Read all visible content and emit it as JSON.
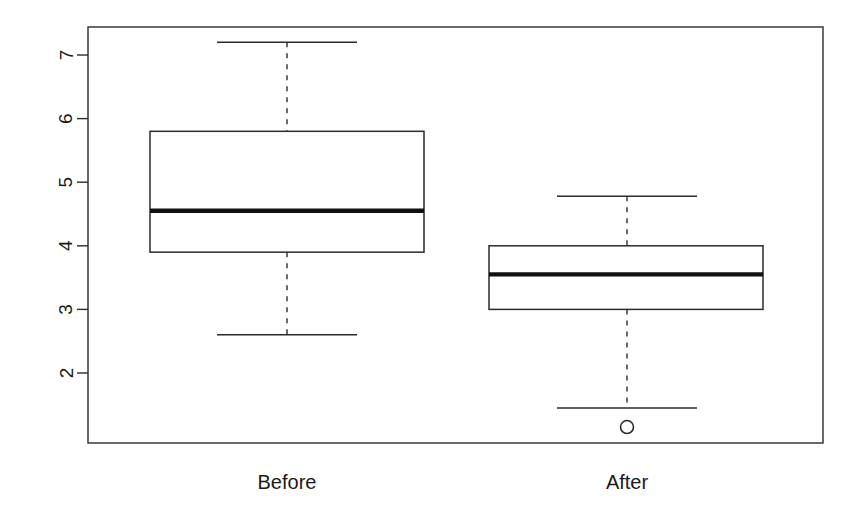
{
  "figure": {
    "title": "",
    "background_color": "#ffffff",
    "line_color": "#2b2b2b",
    "median_color": "#111111",
    "width": 865,
    "height": 521
  },
  "axes": {
    "frame": {
      "left": 88,
      "top": 27,
      "right": 823,
      "bottom": 443
    },
    "y_scale": {
      "value_at_top_tick": 7,
      "pixel_at_top_tick": 55,
      "pixels_per_unit": 63.6
    },
    "y_ticks": [
      {
        "label": "7",
        "value": 7,
        "y": 55
      },
      {
        "label": "6",
        "value": 6,
        "y": 118.6
      },
      {
        "label": "5",
        "value": 5,
        "y": 182.2
      },
      {
        "label": "4",
        "value": 4,
        "y": 245.8
      },
      {
        "label": "3",
        "value": 3,
        "y": 309.4
      },
      {
        "label": "2",
        "value": 2,
        "y": 373
      }
    ],
    "x_tick_labels": [
      {
        "label": "Before",
        "x": 287
      },
      {
        "label": "After",
        "x": 627
      }
    ]
  },
  "chart_data": {
    "type": "box",
    "title": "",
    "xlabel": "",
    "ylabel": "",
    "categories": [
      "Before",
      "After"
    ],
    "ylim": [
      1.05,
      7.5
    ],
    "grid": false,
    "legend": null,
    "axis_orientation": "y-labels-rotated-90",
    "boxes": [
      {
        "name": "Before",
        "center_x": 287,
        "box_left_x": 150,
        "box_right_x": 424,
        "whisker_cap_left_x": 217,
        "whisker_cap_right_x": 357,
        "upper_whisker": 7.2,
        "q3": 5.8,
        "median": 4.55,
        "q1": 3.9,
        "lower_whisker": 2.6,
        "outliers": []
      },
      {
        "name": "After",
        "center_x": 627,
        "box_left_x": 489,
        "box_right_x": 763,
        "whisker_cap_left_x": 557,
        "whisker_cap_right_x": 697,
        "upper_whisker": 4.78,
        "q3": 4.0,
        "median": 3.55,
        "q1": 3.0,
        "lower_whisker": 1.45,
        "outliers": [
          1.15
        ]
      }
    ]
  }
}
